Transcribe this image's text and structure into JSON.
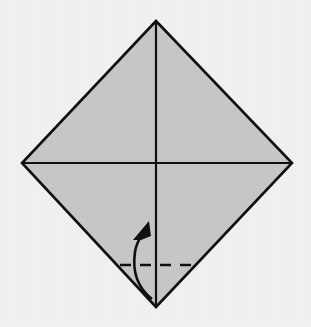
{
  "figure": {
    "canvas": {
      "width": 311,
      "height": 327
    },
    "colors": {
      "background": "#f0f0f0",
      "paper_fill": "#c6c6c6",
      "outline": "#101010",
      "crease": "#101010",
      "fold_line": "#101010",
      "arrow": "#101010"
    },
    "paper": {
      "shape_name": "diamond-square",
      "vertices": {
        "top": {
          "x": 156,
          "y": 21
        },
        "right": {
          "x": 292,
          "y": 163
        },
        "bottom": {
          "x": 156,
          "y": 307
        },
        "left": {
          "x": 22,
          "y": 163
        }
      },
      "outline_width": 2.6
    },
    "creases": [
      {
        "name": "vertical-crease",
        "x1": 156,
        "y1": 21,
        "x2": 156,
        "y2": 307,
        "width": 2.2,
        "style": "solid"
      },
      {
        "name": "horizontal-crease",
        "x1": 22,
        "y1": 163,
        "x2": 292,
        "y2": 163,
        "width": 2.2,
        "style": "solid"
      }
    ],
    "fold_line": {
      "name": "valley-fold-line",
      "x1": 120,
      "y1": 265,
      "x2": 193,
      "y2": 265,
      "width": 2.4,
      "style": "dashed",
      "dash_pattern": "11 9"
    },
    "fold_arrow": {
      "name": "valley-fold-arrow",
      "direction": "up",
      "curve_path": "M 152 299 C 138 288 132 272 135 252 C 136 245 139 239 143 234",
      "width": 2.6,
      "head_points": "149,221 133,240 141,240 151,236",
      "head_filled": true
    }
  }
}
